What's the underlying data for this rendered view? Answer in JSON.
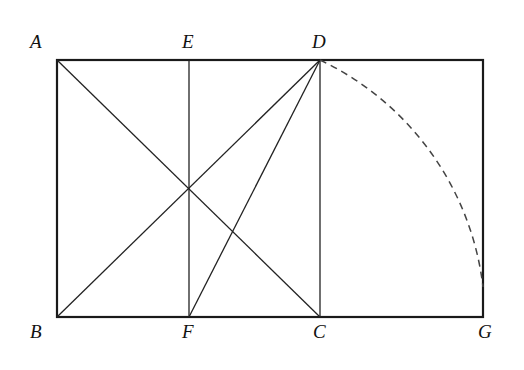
{
  "diagram": {
    "title": "",
    "colors": {
      "stroke": "#222222",
      "outline": "#1a1a1a",
      "dashed": "#444444"
    },
    "points": {
      "A": {
        "label": "A",
        "x": 57,
        "y": 60,
        "lx": 30,
        "ly": 48
      },
      "E": {
        "label": "E",
        "x": 189,
        "y": 60,
        "lx": 182,
        "ly": 48
      },
      "D": {
        "label": "D",
        "x": 320,
        "y": 60,
        "lx": 312,
        "ly": 48
      },
      "B": {
        "label": "B",
        "x": 57,
        "y": 317,
        "lx": 30,
        "ly": 338
      },
      "F": {
        "label": "F",
        "x": 189,
        "y": 317,
        "lx": 182,
        "ly": 338
      },
      "C": {
        "label": "C",
        "x": 320,
        "y": 317,
        "lx": 313,
        "ly": 338
      },
      "G": {
        "label": "G",
        "x": 483,
        "y": 317,
        "lx": 478,
        "ly": 338
      }
    },
    "segments": [
      {
        "name": "outer-rectangle",
        "from": "A",
        "to": "G",
        "style": "solid-bold"
      },
      {
        "name": "line-AC",
        "from": "A",
        "to": "C",
        "style": "solid"
      },
      {
        "name": "line-BD",
        "from": "B",
        "to": "D",
        "style": "solid"
      },
      {
        "name": "line-FD",
        "from": "F",
        "to": "D",
        "style": "solid"
      },
      {
        "name": "line-EF",
        "from": "E",
        "to": "F",
        "style": "solid"
      },
      {
        "name": "line-DC",
        "from": "D",
        "to": "C",
        "style": "solid"
      }
    ],
    "arcs": [
      {
        "name": "arc-D-to-G",
        "center": "F",
        "from": "D",
        "end": {
          "x": 483,
          "y": 287
        },
        "style": "dashed"
      }
    ]
  }
}
